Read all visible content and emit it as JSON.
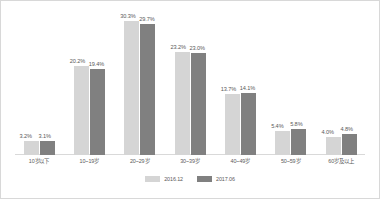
{
  "chart_data": {
    "type": "bar",
    "title": "",
    "xlabel": "",
    "ylabel": "",
    "ylim": [
      0,
      33
    ],
    "grid": false,
    "legend_position": "bottom",
    "categories": [
      "10岁以下",
      "10~19岁",
      "20~29岁",
      "30~39岁",
      "40~49岁",
      "50~59岁",
      "60岁及以上"
    ],
    "series": [
      {
        "name": "2016.12",
        "color": "#d5d5d5",
        "values": [
          3.2,
          20.2,
          30.3,
          23.2,
          13.7,
          5.4,
          4.0
        ],
        "labels": [
          "3.2%",
          "20.2%",
          "30.3%",
          "23.2%",
          "13.7%",
          "5.4%",
          "4.0%"
        ]
      },
      {
        "name": "2017.06",
        "color": "#808080",
        "values": [
          3.1,
          19.4,
          29.7,
          23.0,
          14.1,
          5.8,
          4.8
        ],
        "labels": [
          "3.1%",
          "19.4%",
          "29.7%",
          "23.0%",
          "14.1%",
          "5.8%",
          "4.8%"
        ]
      }
    ]
  },
  "legend": {
    "items": [
      {
        "label": "2016.12",
        "color": "#d5d5d5"
      },
      {
        "label": "2017.06",
        "color": "#808080"
      }
    ]
  },
  "colors": {
    "series_a": "#d5d5d5",
    "series_b": "#808080",
    "baseline": "#d9d9d9",
    "text": "#5a5a5a",
    "border": "#d8d8d8"
  }
}
